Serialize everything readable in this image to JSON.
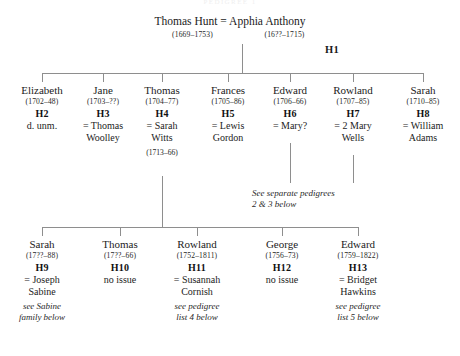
{
  "document": {
    "cut_off_title": "PEDIGREE 1",
    "type": "pedigree-chart"
  },
  "generation1": {
    "father": "Thomas Hunt",
    "marriage_symbol": "=",
    "mother": "Apphia Anthony",
    "father_dates": "(1669–1753)",
    "mother_dates": "(16??–1715)",
    "ref": "H1"
  },
  "generation2": [
    {
      "name": "Elizabeth",
      "dates": "(1702–48)",
      "ref": "H2",
      "spouse_line1": "d. unm.",
      "spouse_line2": "",
      "spouse_dates": "",
      "note": ""
    },
    {
      "name": "Jane",
      "dates": "(1703–??)",
      "ref": "H3",
      "spouse_line1": "= Thomas",
      "spouse_line2": "Woolley",
      "spouse_dates": "",
      "note": ""
    },
    {
      "name": "Thomas",
      "dates": "(1704–77)",
      "ref": "H4",
      "spouse_line1": "= Sarah",
      "spouse_line2": "Witts",
      "spouse_dates": "(1713–66)",
      "note": ""
    },
    {
      "name": "Frances",
      "dates": "(1705–86)",
      "ref": "H5",
      "spouse_line1": "= Lewis",
      "spouse_line2": "Gordon",
      "spouse_dates": "",
      "note": ""
    },
    {
      "name": "Edward",
      "dates": "(1706–66)",
      "ref": "H6",
      "spouse_line1": "= Mary?",
      "spouse_line2": "",
      "spouse_dates": "",
      "note": ""
    },
    {
      "name": "Rowland",
      "dates": "(1707–85)",
      "ref": "H7",
      "spouse_line1": "= 2 Mary",
      "spouse_line2": "Wells",
      "spouse_dates": "",
      "note": ""
    },
    {
      "name": "Sarah",
      "dates": "(1710–85)",
      "ref": "H8",
      "spouse_line1": "= William",
      "spouse_line2": "Adams",
      "spouse_dates": "",
      "note": ""
    }
  ],
  "middle_note": {
    "line1": "See separate pedigrees",
    "line2": "2 & 3 below"
  },
  "generation3": [
    {
      "name": "Sarah",
      "dates": "(17??–88)",
      "ref": "H9",
      "spouse_line1": "= Joseph",
      "spouse_line2": "Sabine",
      "note_line1": "see Sabine",
      "note_line2": "family below"
    },
    {
      "name": "Thomas",
      "dates": "(17??–66)",
      "ref": "H10",
      "spouse_line1": "no issue",
      "spouse_line2": "",
      "note_line1": "",
      "note_line2": ""
    },
    {
      "name": "Rowland",
      "dates": "(1752–1811)",
      "ref": "H11",
      "spouse_line1": "= Susannah",
      "spouse_line2": "Cornish",
      "note_line1": "see pedigree",
      "note_line2": "list 4 below"
    },
    {
      "name": "George",
      "dates": "(1756–73)",
      "ref": "H12",
      "spouse_line1": "no issue",
      "spouse_line2": "",
      "note_line1": "",
      "note_line2": ""
    },
    {
      "name": "Edward",
      "dates": "(1759–1822)",
      "ref": "H13",
      "spouse_line1": "= Bridget",
      "spouse_line2": "Hawkins",
      "note_line1": "see pedigree",
      "note_line2": "list 5 below"
    }
  ],
  "colors": {
    "line": "#8e8e8e",
    "text": "#1a1a1a",
    "background": "#ffffff"
  }
}
